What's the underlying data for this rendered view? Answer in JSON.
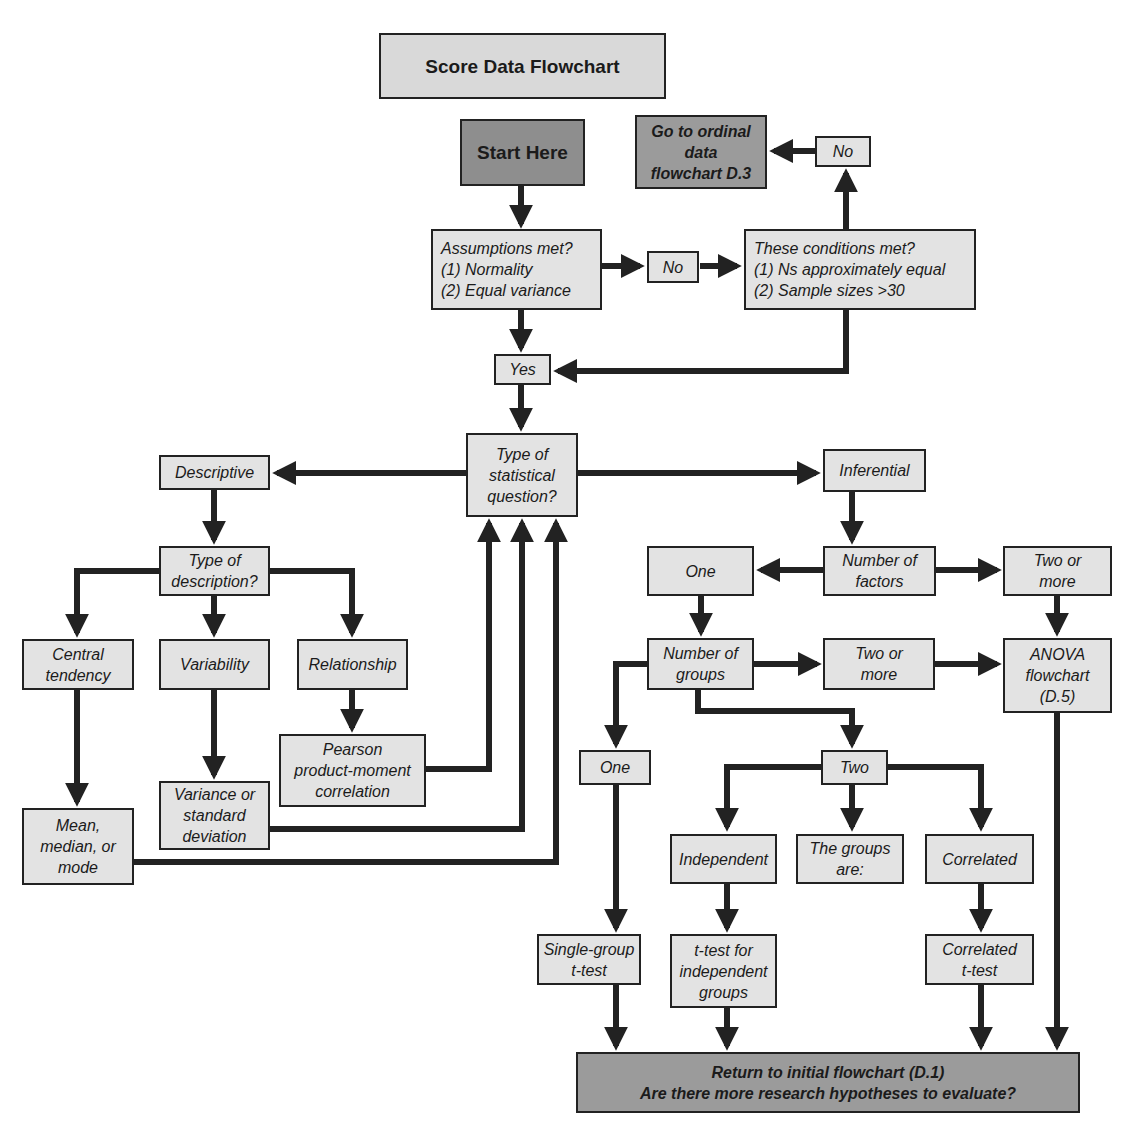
{
  "title": "Score Data Flowchart",
  "colors": {
    "box_fill": "#e3e3e3",
    "terminal_fill": "#9b9b9b",
    "line": "#222222"
  },
  "nodes": {
    "start": "Start Here",
    "ordinal": "Go to ordinal\ndata\nflowchart D.3",
    "no_top": "No",
    "assumptions": "Assumptions met?\n(1) Normality\n(2) Equal variance",
    "no_mid": "No",
    "conditions": "These conditions met?\n(1) Ns approximately equal\n(2) Sample sizes >30",
    "yes": "Yes",
    "question_type": "Type of\nstatistical\nquestion?",
    "descriptive": "Descriptive",
    "inferential": "Inferential",
    "description_type": "Type of\ndescription?",
    "central": "Central\ntendency",
    "variability": "Variability",
    "relationship": "Relationship",
    "pearson": "Pearson\nproduct-moment\ncorrelation",
    "variance": "Variance or\nstandard\ndeviation",
    "mean": "Mean,\nmedian, or\nmode",
    "factors": "Number of\nfactors",
    "factors_one": "One",
    "factors_two_more": "Two or\nmore",
    "groups": "Number of\ngroups",
    "groups_two_more": "Two or\nmore",
    "anova": "ANOVA\nflowchart\n(D.5)",
    "groups_one": "One",
    "groups_two": "Two",
    "independent": "Independent",
    "groups_are": "The groups\nare:",
    "correlated": "Correlated",
    "single_test": "Single-group\nt-test",
    "independent_test": "t-test for\nindependent\ngroups",
    "correlated_test": "Correlated\nt-test",
    "return": "Return to initial flowchart (D.1)\nAre there more research hypotheses to evaluate?"
  }
}
